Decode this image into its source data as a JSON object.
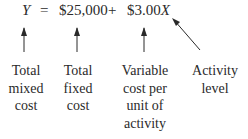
{
  "equation": {
    "lhs": "Y",
    "equals": "=",
    "fixed": "$25,000",
    "plus": "+",
    "variable_coef": "$3.00",
    "variable_var": "X"
  },
  "labels": [
    {
      "id": "total-mixed-cost",
      "lines": [
        "Total",
        "mixed",
        "cost"
      ]
    },
    {
      "id": "total-fixed-cost",
      "lines": [
        "Total",
        "fixed",
        "cost"
      ]
    },
    {
      "id": "variable-cost-per-unit",
      "lines": [
        "Variable",
        "cost per",
        "unit of",
        "activity"
      ]
    },
    {
      "id": "activity-level",
      "lines": [
        "Activity",
        "level"
      ]
    }
  ]
}
